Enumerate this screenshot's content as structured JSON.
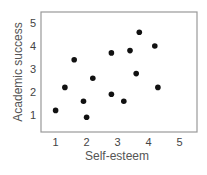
{
  "chart_data": {
    "type": "scatter",
    "title": "",
    "xlabel": "Self-esteem",
    "ylabel": "Academic success",
    "xlim": [
      0.5,
      5.5
    ],
    "ylim": [
      0.5,
      5.5
    ],
    "xticks": [
      1,
      2,
      3,
      4,
      5
    ],
    "yticks": [
      1,
      2,
      3,
      4,
      5
    ],
    "grid": false,
    "legend": null,
    "points": [
      {
        "x": 1.0,
        "y": 1.2
      },
      {
        "x": 1.3,
        "y": 2.2
      },
      {
        "x": 1.6,
        "y": 3.4
      },
      {
        "x": 1.9,
        "y": 1.6
      },
      {
        "x": 2.0,
        "y": 0.9
      },
      {
        "x": 2.2,
        "y": 2.6
      },
      {
        "x": 2.8,
        "y": 3.7
      },
      {
        "x": 2.8,
        "y": 1.9
      },
      {
        "x": 3.2,
        "y": 1.6
      },
      {
        "x": 3.4,
        "y": 3.8
      },
      {
        "x": 3.6,
        "y": 2.8
      },
      {
        "x": 3.7,
        "y": 4.6
      },
      {
        "x": 4.2,
        "y": 4.0
      },
      {
        "x": 4.3,
        "y": 2.2
      }
    ],
    "marker_color": "#111111",
    "frame_color": "#999999"
  }
}
